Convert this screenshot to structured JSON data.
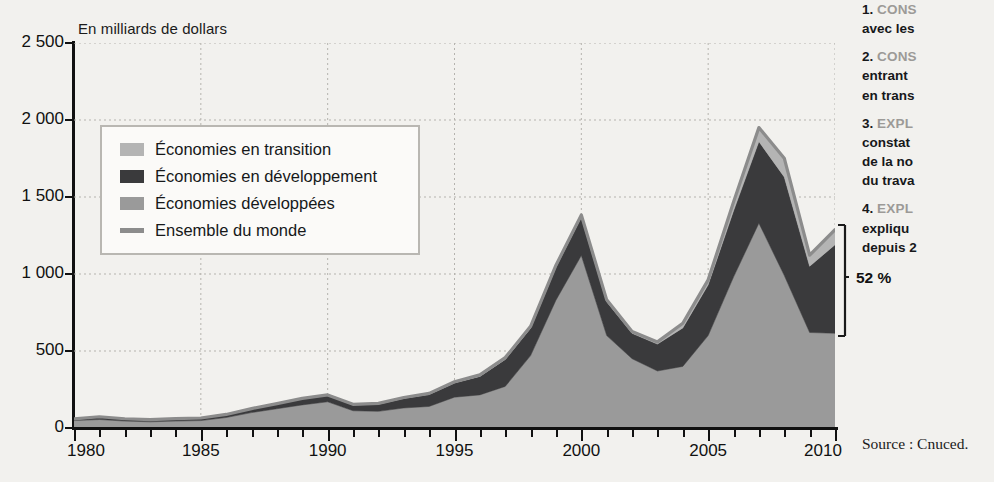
{
  "chart_data": {
    "type": "area",
    "stacked": true,
    "title": "",
    "subtitle": "",
    "xlabel": "",
    "ylabel": "En milliards de dollars",
    "unit_note": "En milliards de dollars",
    "xlim": [
      1980,
      2010
    ],
    "ylim": [
      0,
      2500
    ],
    "grid": true,
    "grid_style": "dashed",
    "legend_position": "inside-top-left",
    "x": [
      1980,
      1981,
      1982,
      1983,
      1984,
      1985,
      1986,
      1987,
      1988,
      1989,
      1990,
      1991,
      1992,
      1993,
      1994,
      1995,
      1996,
      1997,
      1998,
      1999,
      2000,
      2001,
      2002,
      2003,
      2004,
      2005,
      2006,
      2007,
      2008,
      2009,
      2010
    ],
    "ytick_labels": [
      "0",
      "500",
      "1 000",
      "1 500",
      "2 000",
      "2 500"
    ],
    "ytick_values": [
      0,
      500,
      1000,
      1500,
      2000,
      2500
    ],
    "xtick_labels": [
      "1980",
      "1985",
      "1990",
      "1995",
      "2000",
      "2005",
      "2010"
    ],
    "xtick_values": [
      1980,
      1985,
      1990,
      1995,
      2000,
      2005,
      2010
    ],
    "series": [
      {
        "name": "Économies développées",
        "color": "#9a9a9a",
        "order": 1,
        "values": [
          48,
          55,
          45,
          40,
          45,
          48,
          68,
          100,
          125,
          150,
          170,
          112,
          108,
          130,
          140,
          200,
          215,
          270,
          470,
          830,
          1120,
          600,
          450,
          370,
          400,
          600,
          980,
          1330,
          990,
          620,
          615
        ]
      },
      {
        "name": "Économies en développement",
        "color": "#3a3a3c",
        "order": 2,
        "values": [
          11,
          18,
          15,
          14,
          16,
          17,
          20,
          26,
          32,
          40,
          42,
          38,
          47,
          62,
          78,
          92,
          120,
          175,
          178,
          215,
          250,
          220,
          165,
          175,
          250,
          330,
          430,
          530,
          640,
          430,
          575
        ]
      },
      {
        "name": "Économies en transition",
        "color": "#b4b4b4",
        "order": 3,
        "values": [
          0,
          0,
          0,
          0,
          0,
          0,
          0,
          0,
          1,
          2,
          3,
          4,
          5,
          6,
          7,
          8,
          10,
          12,
          12,
          12,
          13,
          12,
          12,
          14,
          30,
          32,
          57,
          91,
          122,
          72,
          98
        ]
      }
    ],
    "line_series": {
      "name": "Ensemble du monde",
      "color": "#8c8c8c",
      "values": [
        59,
        73,
        60,
        54,
        61,
        65,
        88,
        126,
        158,
        192,
        215,
        154,
        160,
        198,
        225,
        300,
        345,
        457,
        660,
        1057,
        1383,
        832,
        627,
        559,
        680,
        962,
        1467,
        1951,
        1752,
        1122,
        1288
      ]
    },
    "annotation": {
      "label": "52 %",
      "describes": "Part des économies en développement et en transition dans le total mondial en 2010"
    }
  },
  "legend": {
    "items": [
      {
        "label": "Économies en transition",
        "color": "#b4b4b4",
        "marker": "swatch"
      },
      {
        "label": "Économies en développement",
        "color": "#3a3a3c",
        "marker": "swatch"
      },
      {
        "label": "Économies développées",
        "color": "#9a9a9a",
        "marker": "swatch"
      },
      {
        "label": "Ensemble du monde",
        "color": "#8c8c8c",
        "marker": "line"
      }
    ]
  },
  "side_panel": {
    "items": [
      {
        "number": "1.",
        "keyword": "CONS",
        "rest_lines": [
          "avec les"
        ]
      },
      {
        "number": "2.",
        "keyword": "CONS",
        "rest_lines": [
          "entrant",
          "en trans"
        ]
      },
      {
        "number": "3.",
        "keyword": "EXPL",
        "rest_lines": [
          "constat",
          "de la no",
          "du trava"
        ]
      },
      {
        "number": "4.",
        "keyword": "EXPL",
        "rest_lines": [
          "expliqu",
          "depuis 2"
        ]
      }
    ],
    "source": "Source : Cnuced."
  },
  "colors": {
    "background": "#f2f1ee",
    "axis": "#111111",
    "grid": "#b5b3ae",
    "developed": "#9a9a9a",
    "developing": "#3a3a3c",
    "transition": "#b4b4b4",
    "world_line": "#8c8c8c",
    "legend_border": "#b9b7b2",
    "legend_fill": "#fbfaf8",
    "keyword": "#9c9a97"
  }
}
